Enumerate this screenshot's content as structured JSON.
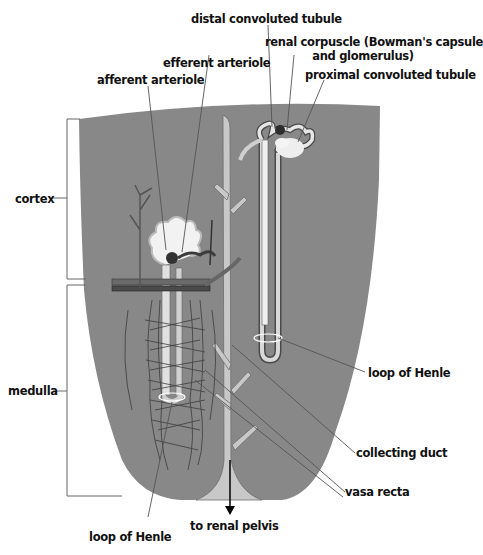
{
  "diagram": {
    "colors": {
      "background": "#ffffff",
      "tissue": "#8a8a8a",
      "tissue_dark": "#7b7b7b",
      "tubule_light": "#e8e8e8",
      "tubule_outline": "#4a4a4a",
      "collecting_duct": "#c9c9c9",
      "capillary": "#3a3a3a",
      "leader_line": "#555555",
      "text": "#111111"
    },
    "regions": [
      {
        "id": "cortex",
        "label": "cortex"
      },
      {
        "id": "medulla",
        "label": "medulla"
      }
    ],
    "labels": {
      "distal_convoluted_tubule": "distal convoluted tubule",
      "renal_corpuscle_line1": "renal corpuscle (Bowman's capsule",
      "renal_corpuscle_line2": "and glomerulus)",
      "efferent_arteriole": "efferent arteriole",
      "afferent_arteriole": "afferent arteriole",
      "proximal_convoluted_tubule": "proximal convoluted tubule",
      "cortex": "cortex",
      "medulla": "medulla",
      "loop_of_henle_right": "loop of Henle",
      "collecting_duct": "collecting duct",
      "vasa_recta": "vasa recta",
      "to_renal_pelvis": "to renal pelvis",
      "loop_of_henle_bottom": "loop of Henle"
    }
  }
}
